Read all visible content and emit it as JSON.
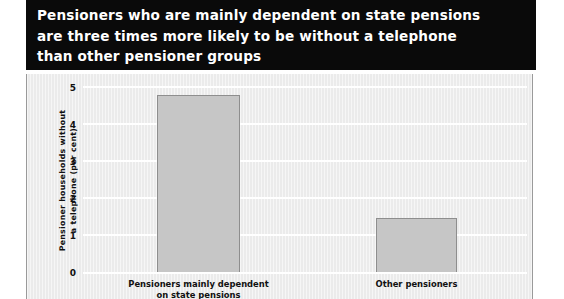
{
  "title": "Pensioners who are mainly dependent on state pensions\nare three times more likely to be without a telephone\nthan other pensioner groups",
  "colors": {
    "banner_background": "#0a0a0a",
    "banner_text": "#ffffff",
    "panel_background": "#ebebeb",
    "bar_fill": "#c6c6c6",
    "bar_border": "#8e8e8e",
    "gridline": "#ffffff",
    "axis_text": "#111111"
  },
  "chart_data": {
    "type": "bar",
    "title": "Pensioners who are mainly dependent on state pensions are three times more likely to be without a telephone than other pensioner groups",
    "categories": [
      "Pensioners mainly dependent\non state pensions",
      "Other pensioners"
    ],
    "values": [
      4.8,
      1.5
    ],
    "xlabel": "",
    "ylabel": "Pensioner households without\na telephone (per cent)",
    "ylim": [
      0,
      5
    ],
    "yticks": [
      "0",
      "1",
      "2",
      "3",
      "4",
      "5"
    ],
    "ytick_values": [
      0,
      1,
      2,
      3,
      4,
      5
    ],
    "grid": true,
    "legend": false
  }
}
